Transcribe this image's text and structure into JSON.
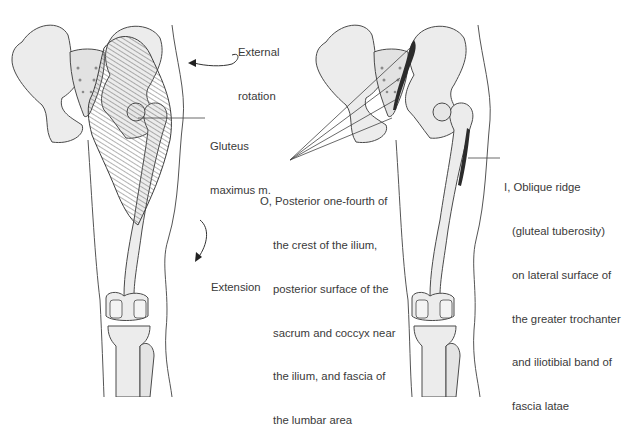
{
  "figure": {
    "panels": [
      {
        "id": "left",
        "view": "posterior",
        "muscle": "Gluteus maximus m.",
        "labels": {
          "external_rotation": [
            "External",
            "rotation"
          ],
          "muscle_name": [
            "Gluteus",
            "maximus m."
          ],
          "extension": "Extension"
        }
      },
      {
        "id": "right",
        "view": "posterior",
        "labels": {
          "origin": [
            "O, Posterior one-fourth of",
            "the crest of the ilium,",
            "posterior surface of the",
            "sacrum and coccyx near",
            "the ilium, and fascia of",
            "the lumbar area"
          ],
          "insertion": [
            "I, Oblique ridge",
            "(gluteal tuberosity)",
            "on lateral surface of",
            "the greater trochanter",
            "and iliotibial band of",
            "fascia latae"
          ]
        }
      }
    ],
    "colors": {
      "bone_fill": "#ececec",
      "bone_stroke": "#4a4a4a",
      "muscle": "#6a6a6a",
      "attachment": "#2b2b2b",
      "text": "#3a3a3a"
    }
  }
}
